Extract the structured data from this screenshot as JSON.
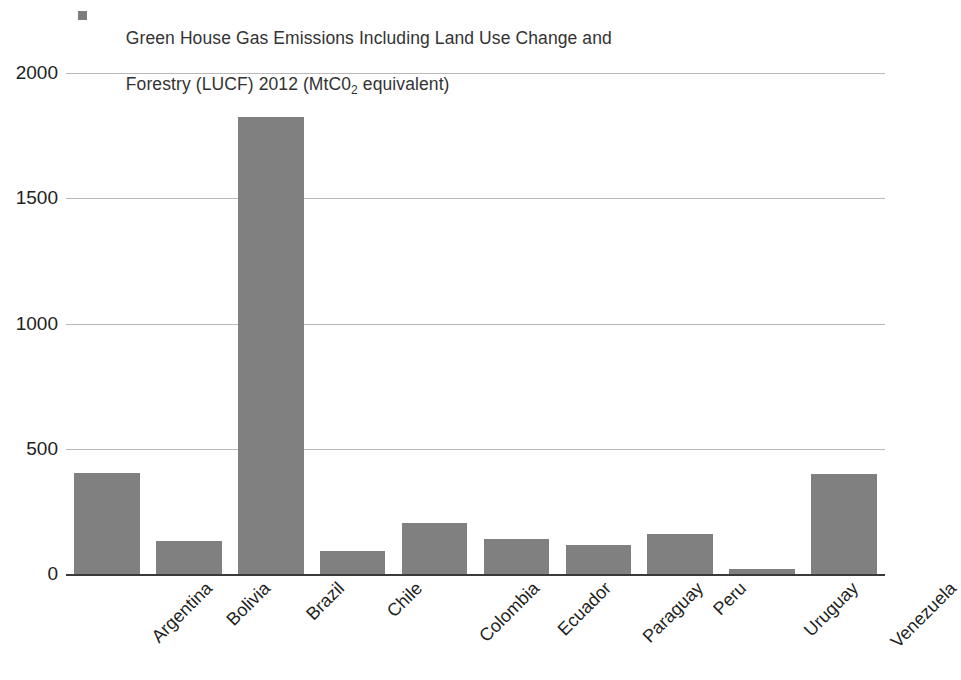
{
  "chart_data": {
    "type": "bar",
    "legend": {
      "position": "top-left",
      "entries": [
        {
          "label_line1": "Green House Gas Emissions Including Land Use Change and",
          "label_line2_pre": "Forestry (LUCF) 2012 (MtC0",
          "label_line2_sub": "2",
          "label_line2_post": " equivalent)",
          "color": "#7d7d7d"
        }
      ]
    },
    "categories": [
      "Argentina",
      "Bolivia",
      "Brazil",
      "Chile",
      "Colombia",
      "Ecuador",
      "Paraguay",
      "Peru",
      "Uruguay",
      "Venezuela"
    ],
    "values": [
      405,
      130,
      1825,
      90,
      205,
      140,
      115,
      160,
      20,
      400
    ],
    "series": [
      {
        "name": "Green House Gas Emissions Including Land Use Change and Forestry (LUCF) 2012 (MtC02 equivalent)",
        "color": "#808080",
        "values": [
          405,
          130,
          1825,
          90,
          205,
          140,
          115,
          160,
          20,
          400
        ]
      }
    ],
    "xlabel": "",
    "ylabel": "",
    "ylim": [
      0,
      2000
    ],
    "yticks": [
      0,
      500,
      1000,
      1500,
      2000
    ],
    "ytick_labels": [
      "0",
      "500",
      "1000",
      "1500",
      "2000"
    ],
    "grid": true,
    "grid_color": "#b9b9b9",
    "axis_color": "#3a3a3a",
    "background": "#ffffff",
    "xlabel_rotation": -45
  }
}
